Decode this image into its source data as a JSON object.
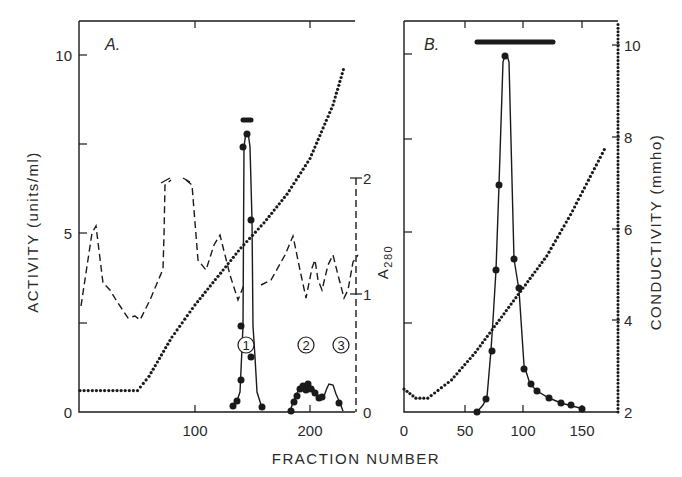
{
  "chart_data": [
    {
      "panel": "A.",
      "type": "line",
      "xlabel": "FRACTION NUMBER",
      "ylabel_left": "ACTIVITY (units/ml)",
      "ylabel_right": "A280",
      "xlim": [
        0,
        240
      ],
      "ylim_left": [
        0,
        11
      ],
      "ylim_right": [
        0,
        2.2
      ],
      "x_ticks": [
        100,
        200
      ],
      "y_ticks_left": [
        0,
        5,
        10
      ],
      "y_ticks_right": [
        0,
        1,
        2
      ],
      "annotations": [
        "1",
        "2",
        "3"
      ],
      "pooled_bar": {
        "x_start": 140,
        "x_end": 148,
        "y": 8.1
      },
      "series": [
        {
          "name": "Activity",
          "style": "solid line with filled circles",
          "x": [
            133,
            136,
            139,
            141,
            143,
            145,
            147,
            149,
            153,
            157,
            184,
            186,
            188,
            190,
            192,
            194,
            196,
            198,
            200,
            204,
            208,
            212,
            216,
            220,
            226,
            232
          ],
          "y": [
            0.2,
            0.5,
            2.4,
            7.4,
            7.8,
            5.4,
            1.5,
            1.0,
            0.3,
            0.2,
            0.1,
            0.3,
            0.5,
            0.6,
            0.7,
            0.65,
            0.75,
            0.6,
            0.5,
            0.35,
            0.4,
            0.8,
            0.75,
            0.5,
            0.2,
            0.05
          ]
        },
        {
          "name": "A280",
          "style": "dashed line",
          "x": [
            0,
            10,
            14,
            20,
            30,
            40,
            50,
            60,
            70,
            73,
            78,
            88,
            92,
            100,
            110,
            120,
            130,
            135,
            140,
            148,
            160,
            170,
            180,
            188,
            192,
            198,
            204,
            208,
            212,
            220,
            228,
            234,
            238
          ],
          "y": [
            0.9,
            1.55,
            1.3,
            1.0,
            0.9,
            0.78,
            0.75,
            0.95,
            1.0,
            1.75,
            1.75,
            1.2,
            1.0,
            1.45,
            1.0,
            0.75,
            0.8,
            1.25,
            0.9,
            0.8,
            1.0,
            1.45,
            1.1,
            0.75,
            1.25,
            0.95,
            1.15,
            0.95,
            1.0,
            1.3,
            0.92,
            0.9,
            0.9
          ]
        },
        {
          "name": "Conductivity (gradient)",
          "style": "dotted line",
          "x": [
            0,
            25,
            50,
            60,
            80,
            100,
            120,
            140,
            160,
            180,
            200,
            220,
            230
          ],
          "y": [
            0.6,
            0.6,
            0.6,
            1.0,
            2.1,
            3.0,
            3.8,
            4.6,
            5.3,
            6.1,
            7.1,
            8.6,
            9.7
          ]
        }
      ]
    },
    {
      "panel": "B.",
      "type": "line",
      "xlabel": "FRACTION NUMBER",
      "ylabel_left": "A280",
      "ylabel_right": "CONDUCTIVITY (mmho)",
      "xlim": [
        0,
        180
      ],
      "ylim_right": [
        2,
        10.4
      ],
      "x_ticks": [
        0,
        50,
        100,
        150
      ],
      "y_ticks_right": [
        2,
        4,
        6,
        8,
        10
      ],
      "pooled_bar": {
        "x_start": 62,
        "x_end": 125
      },
      "series": [
        {
          "name": "A280 / Activity",
          "style": "solid line with filled circles",
          "x": [
            60,
            66,
            70,
            72,
            80,
            86,
            92,
            96,
            102,
            108,
            115,
            125,
            135,
            142,
            150
          ],
          "y_pixel_fraction": [
            0.0,
            0.04,
            0.19,
            0.46,
            1.0,
            0.43,
            0.51,
            0.58,
            0.12,
            0.08,
            0.06,
            0.04,
            0.03,
            0.02,
            0.01
          ]
        },
        {
          "name": "Conductivity",
          "style": "dotted line",
          "x": [
            0,
            10,
            20,
            40,
            60,
            80,
            100,
            120,
            140,
            160,
            170
          ],
          "y": [
            2.5,
            2.3,
            2.3,
            2.7,
            3.3,
            4.0,
            4.7,
            5.4,
            6.3,
            7.3,
            7.8
          ]
        }
      ]
    }
  ],
  "labels": {
    "panel_a": "A.",
    "panel_b": "B.",
    "x_title": "FRACTION NUMBER",
    "y_left_title": "ACTIVITY (units/ml)",
    "a280_title": "A",
    "a280_sub": "280",
    "y_right_title": "CONDUCTIVITY (mmho)",
    "peak_1": "1",
    "peak_2": "2",
    "peak_3": "3",
    "a_left_ticks": [
      "0",
      "5",
      "10"
    ],
    "a_right_ticks": [
      "0",
      "1",
      "2"
    ],
    "a_x_ticks": [
      "100",
      "200"
    ],
    "b_x_ticks": [
      "0",
      "50",
      "100",
      "150"
    ],
    "b_right_ticks": [
      "2",
      "4",
      "6",
      "8",
      "10"
    ]
  }
}
